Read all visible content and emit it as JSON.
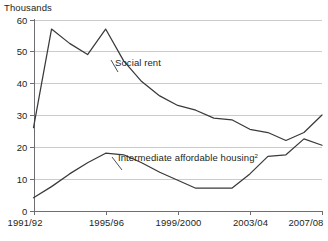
{
  "chart_data": {
    "type": "line",
    "title": "",
    "unit_label": "Thousands",
    "xlabel": "",
    "ylabel": "",
    "ylim": [
      0,
      60
    ],
    "yticks": [
      0,
      10,
      20,
      30,
      40,
      50,
      60
    ],
    "ytick_labels": [
      "0",
      "10",
      "20",
      "30",
      "40",
      "50",
      "60"
    ],
    "grid": true,
    "legend_position": "inline-annotation",
    "x": [
      "1991/92",
      "1992/93",
      "1993/94",
      "1994/95",
      "1995/96",
      "1996/97",
      "1997/98",
      "1998/99",
      "1999/2000",
      "2000/01",
      "2001/02",
      "2002/03",
      "2003/04",
      "2004/05",
      "2005/06",
      "2006/07",
      "2007/08"
    ],
    "xtick_labels": [
      "1991/92",
      "1995/96",
      "1999/2000",
      "2003/04",
      "2007/08"
    ],
    "xtick_indices": [
      0,
      4,
      8,
      12,
      16
    ],
    "series": [
      {
        "name": "Social rent",
        "label": "Social rent",
        "color": "#3a3a3c",
        "values": [
          26.0,
          57.0,
          52.5,
          49.0,
          57.0,
          47.0,
          40.5,
          36.0,
          33.0,
          31.5,
          29.0,
          28.5,
          25.5,
          24.5,
          22.0,
          24.5,
          30.0
        ]
      },
      {
        "name": "Intermediate affordable housing",
        "label": "Intermediate affordable housing",
        "label_superscript": "2",
        "color": "#3a3a3c",
        "values": [
          4.0,
          7.5,
          11.5,
          15.0,
          18.0,
          17.5,
          15.0,
          12.0,
          9.5,
          7.0,
          7.0,
          7.0,
          11.5,
          17.0,
          17.5,
          22.5,
          20.5
        ]
      }
    ]
  }
}
